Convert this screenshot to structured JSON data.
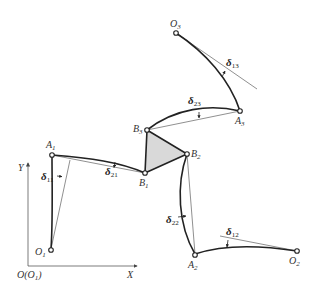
{
  "diagram": {
    "type": "mechanism-deflection",
    "axes": {
      "origin_label": "O(O",
      "origin_sub": "1",
      "origin_close": ")",
      "x_label": "X",
      "y_label": "Y"
    },
    "points": {
      "O1": {
        "name": "O",
        "sub": "1"
      },
      "A1": {
        "name": "A",
        "sub": "1"
      },
      "B1": {
        "name": "B",
        "sub": "1"
      },
      "B2": {
        "name": "B",
        "sub": "2"
      },
      "B3": {
        "name": "B",
        "sub": "3"
      },
      "A2": {
        "name": "A",
        "sub": "2"
      },
      "O2": {
        "name": "O",
        "sub": "2"
      },
      "A3": {
        "name": "A",
        "sub": "3"
      },
      "O3": {
        "name": "O",
        "sub": "3"
      }
    },
    "deflections": {
      "d11": {
        "sym": "δ",
        "sub": "11"
      },
      "d21": {
        "sym": "δ",
        "sub": "21"
      },
      "d22": {
        "sym": "δ",
        "sub": "22"
      },
      "d12": {
        "sym": "δ",
        "sub": "12"
      },
      "d23": {
        "sym": "δ",
        "sub": "23"
      },
      "d13": {
        "sym": "δ",
        "sub": "13"
      }
    },
    "colors": {
      "line": "#222222",
      "fill_triangle": "#d9d9d9",
      "background": "#ffffff"
    }
  }
}
